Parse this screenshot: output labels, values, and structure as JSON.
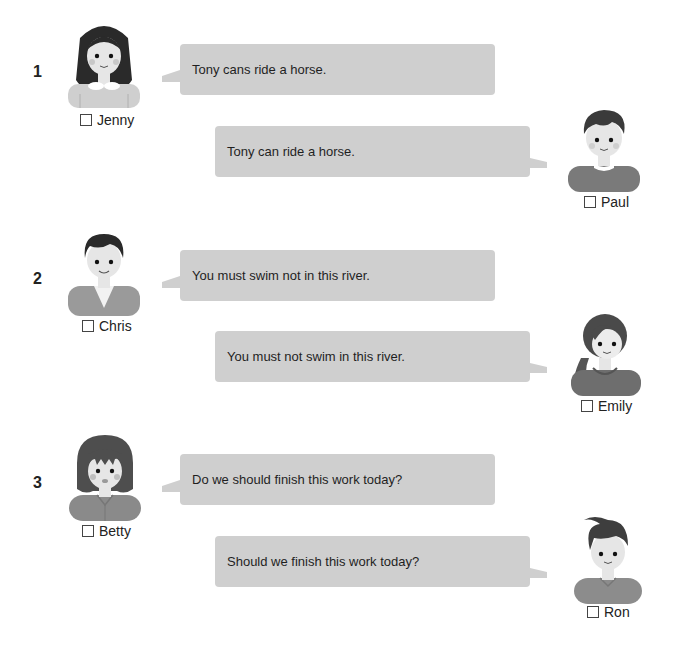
{
  "colors": {
    "bubble": "#cfcfcf",
    "background": "#ffffff",
    "text": "#1f1f1f"
  },
  "items": [
    {
      "number": "1",
      "speaker_a": {
        "name": "Jenny",
        "sentence": "Tony cans ride a horse."
      },
      "speaker_b": {
        "name": "Paul",
        "sentence": "Tony can ride a horse."
      }
    },
    {
      "number": "2",
      "speaker_a": {
        "name": "Chris",
        "sentence": "You must swim not in this river."
      },
      "speaker_b": {
        "name": "Emily",
        "sentence": "You must not swim in this river."
      }
    },
    {
      "number": "3",
      "speaker_a": {
        "name": "Betty",
        "sentence": "Do we should finish this work today?"
      },
      "speaker_b": {
        "name": "Ron",
        "sentence": "Should we finish this work today?"
      }
    }
  ],
  "icons": {
    "checkbox": "empty-checkbox",
    "avatar": "person-illustration"
  }
}
